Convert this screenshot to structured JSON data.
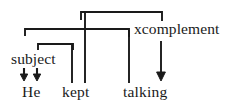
{
  "figure": {
    "type": "dependency-grammar-diagram",
    "caption": "",
    "ink_color": "#1a1a1a",
    "background_color": "#ffffff",
    "width": 236,
    "height": 108
  },
  "relations": [
    {
      "id": "subject",
      "label": "subject",
      "x": 11,
      "y": 51
    },
    {
      "id": "xcomplement",
      "label": "xcomplement",
      "x": 134,
      "y": 21
    }
  ],
  "words": [
    {
      "id": "he",
      "label": "He",
      "x": 22,
      "y": 84
    },
    {
      "id": "kept",
      "label": "kept",
      "x": 62,
      "y": 84
    },
    {
      "id": "talking",
      "label": "talking",
      "x": 123,
      "y": 84
    }
  ],
  "sentence": "He kept talking",
  "edges": {
    "brackets": [
      {
        "id": "top-bracket",
        "y": 12,
        "x_left": 81,
        "x_right": 162,
        "stub_left": 8,
        "stub_right": 9
      },
      {
        "id": "middle-bracket",
        "y": 29,
        "x_left": 25,
        "x_right": 129,
        "stub_left": 7,
        "stub_right": 8
      },
      {
        "id": "lower-bracket",
        "y": 44,
        "x_left": 38,
        "x_right": 73,
        "stub_left": 6,
        "stub_right": 6
      }
    ],
    "connectors": [
      {
        "id": "subject-to-kept-line",
        "x": 72,
        "y_top": 44,
        "y_bottom": 83
      },
      {
        "id": "top-to-kept-line",
        "x": 85,
        "y_top": 29,
        "y_bottom": 83
      },
      {
        "id": "middle-to-talking",
        "x": 129,
        "y_top": 29,
        "y_bottom": 83
      }
    ],
    "arrows": [
      {
        "id": "subject-arrow-left",
        "x": 24,
        "y_top": 69,
        "y_bottom": 80
      },
      {
        "id": "subject-arrow-right",
        "x": 37,
        "y_top": 69,
        "y_bottom": 80
      },
      {
        "id": "xcomplement-arrow",
        "x": 161,
        "y_top": 41,
        "y_bottom": 80
      }
    ]
  }
}
